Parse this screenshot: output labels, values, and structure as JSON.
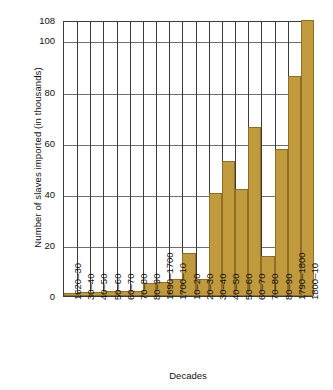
{
  "chart_data": {
    "type": "bar",
    "title": "",
    "xlabel": "Decades",
    "ylabel": "Number of slaves imported (in thousands)",
    "categories": [
      "1620–30",
      "30–40",
      "40–50",
      "50–60",
      "60–70",
      "70–80",
      "80–90",
      "1690–1700",
      "1700–10",
      "10–20",
      "20–30",
      "30–40",
      "40–50",
      "50–60",
      "60–70",
      "70–80",
      "80–90",
      "1790–1800",
      "1800–10"
    ],
    "values": [
      1,
      1.5,
      1.5,
      2,
      2,
      2,
      5,
      5.5,
      6.5,
      17,
      6.5,
      40.5,
      53,
      42,
      66,
      15.5,
      57.5,
      86,
      108
    ],
    "ylim": [
      0,
      108
    ],
    "yticks": [
      0,
      20,
      40,
      60,
      80,
      100,
      108
    ],
    "ytick_labels": [
      "0",
      "20",
      "40",
      "60",
      "80",
      "100",
      "108"
    ],
    "grid": "both",
    "legend": "none",
    "bar_color": "#c19a3d",
    "bar_edge_color": "#8d6f26",
    "axis_color": "#3b3b3b",
    "gridline_color": "#6f6f6f"
  }
}
